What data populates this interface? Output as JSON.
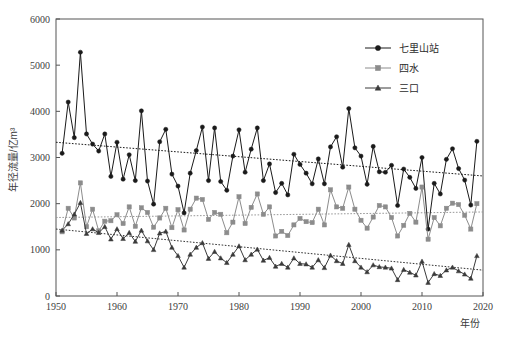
{
  "chart_data": {
    "type": "line",
    "title": "",
    "xlabel": "年份",
    "ylabel": "年径流量/亿m³",
    "xlim": [
      1950,
      2020
    ],
    "ylim": [
      0,
      6000
    ],
    "xticks": [
      1950,
      1960,
      1970,
      1980,
      1990,
      2000,
      2010,
      2020
    ],
    "yticks": [
      0,
      1000,
      2000,
      3000,
      4000,
      5000,
      6000
    ],
    "grid": false,
    "legend_position": "top-right",
    "x": [
      1951,
      1952,
      1953,
      1954,
      1955,
      1956,
      1957,
      1958,
      1959,
      1960,
      1961,
      1962,
      1963,
      1964,
      1965,
      1966,
      1967,
      1968,
      1969,
      1970,
      1971,
      1972,
      1973,
      1974,
      1975,
      1976,
      1977,
      1978,
      1979,
      1980,
      1981,
      1982,
      1983,
      1984,
      1985,
      1986,
      1987,
      1988,
      1989,
      1990,
      1991,
      1992,
      1993,
      1994,
      1995,
      1996,
      1997,
      1998,
      1999,
      2000,
      2001,
      2002,
      2003,
      2004,
      2005,
      2006,
      2007,
      2008,
      2009,
      2010,
      2011,
      2012,
      2013,
      2014,
      2015,
      2016,
      2017,
      2018,
      2019
    ],
    "series": [
      {
        "name": "七里山站",
        "marker": "circle",
        "color": "#1a1a1a",
        "values": [
          3090,
          4200,
          3430,
          5280,
          3510,
          3290,
          3140,
          3510,
          2590,
          3330,
          2530,
          3060,
          2500,
          4010,
          2490,
          1990,
          3340,
          3610,
          2640,
          2380,
          1800,
          2660,
          3150,
          3660,
          2500,
          3640,
          2480,
          2290,
          3030,
          3600,
          2680,
          3180,
          3640,
          2500,
          2860,
          2240,
          2440,
          2190,
          3070,
          2850,
          2660,
          2430,
          2970,
          2430,
          3230,
          3450,
          2790,
          4060,
          3210,
          3030,
          2420,
          3240,
          2690,
          2680,
          2830,
          1960,
          2750,
          2570,
          2330,
          3000,
          1450,
          2440,
          2210,
          2960,
          3190,
          2760,
          2510,
          1970,
          3350
        ]
      },
      {
        "name": "四水",
        "marker": "square",
        "color": "#8c8c8c",
        "values": [
          1390,
          1900,
          1690,
          2450,
          1500,
          1880,
          1410,
          1620,
          1630,
          1760,
          1570,
          1930,
          1510,
          1910,
          1810,
          1490,
          1690,
          1900,
          1480,
          1870,
          1430,
          1880,
          2120,
          2090,
          1660,
          1810,
          1770,
          1370,
          1600,
          2150,
          1570,
          1920,
          2210,
          1770,
          1930,
          1300,
          1400,
          1310,
          1540,
          1680,
          1610,
          1590,
          1880,
          1540,
          2300,
          1930,
          1900,
          2360,
          1880,
          1640,
          1470,
          1710,
          1960,
          1930,
          1700,
          1300,
          1530,
          1790,
          1600,
          2360,
          1230,
          1700,
          1520,
          1900,
          2010,
          1980,
          1750,
          1450,
          2000
        ]
      },
      {
        "name": "三口",
        "marker": "triangle",
        "color": "#3b3b3b",
        "values": [
          1420,
          1560,
          1770,
          2020,
          1350,
          1450,
          1370,
          1500,
          1230,
          1450,
          1240,
          1370,
          1180,
          1420,
          1190,
          1000,
          1360,
          1400,
          1050,
          870,
          620,
          900,
          1050,
          1150,
          810,
          960,
          820,
          720,
          900,
          1080,
          780,
          900,
          1010,
          770,
          830,
          640,
          700,
          620,
          820,
          700,
          690,
          620,
          780,
          610,
          880,
          760,
          700,
          1110,
          760,
          620,
          520,
          670,
          630,
          620,
          600,
          350,
          570,
          510,
          450,
          750,
          290,
          480,
          440,
          560,
          620,
          540,
          470,
          380,
          870
        ]
      }
    ],
    "trends": [
      {
        "name": "七里山站趋势线",
        "x0": 1950,
        "y0": 3330,
        "x1": 2020,
        "y1": 2600,
        "color": "#1a1a1a"
      },
      {
        "name": "四水趋势线",
        "x0": 1950,
        "y0": 1700,
        "x1": 2020,
        "y1": 1820,
        "color": "#999999"
      },
      {
        "name": "三口趋势线",
        "x0": 1950,
        "y0": 1450,
        "x1": 2020,
        "y1": 560,
        "color": "#333333"
      }
    ]
  },
  "axes": {
    "x_title": "年份",
    "y_title": "年径流量/亿m³",
    "x_tick_labels": [
      "1950",
      "1960",
      "1970",
      "1980",
      "1990",
      "2000",
      "2010",
      "2020"
    ],
    "y_tick_labels": [
      "0",
      "1000",
      "2000",
      "3000",
      "4000",
      "5000",
      "6000"
    ]
  },
  "legend": {
    "items": [
      {
        "label": "七里山站",
        "marker": "circle",
        "color": "#1a1a1a"
      },
      {
        "label": "四水",
        "marker": "square",
        "color": "#8c8c8c"
      },
      {
        "label": "三口",
        "marker": "triangle",
        "color": "#3b3b3b"
      }
    ]
  }
}
